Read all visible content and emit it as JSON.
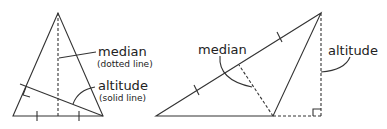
{
  "left_figure": {
    "median_label": "median",
    "median_note": "(dotted line)",
    "altitude_label": "altitude",
    "altitude_note": "(solid line)"
  },
  "right_figure": {
    "median_label": "median",
    "altitude_label": "altitude"
  },
  "colors": {
    "line": "#333333",
    "text": "#222222",
    "background": "#ffffff"
  }
}
